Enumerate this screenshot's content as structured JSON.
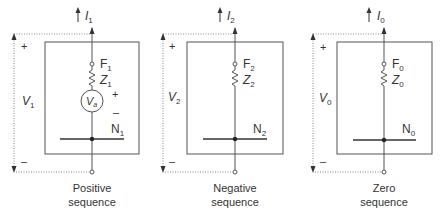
{
  "colors": {
    "line": "#555555",
    "dotted": "#888888",
    "text": "#333333",
    "background": "#ffffff"
  },
  "panels": [
    {
      "current": {
        "sym": "I",
        "sub": "1"
      },
      "voltage": {
        "sym": "V",
        "sub": "1"
      },
      "fault_node": {
        "sym": "F",
        "sub": "1"
      },
      "impedance": {
        "sym": "Z",
        "sub": "1"
      },
      "source": {
        "sym": "V",
        "sub": "a"
      },
      "neutral": {
        "sym": "N",
        "sub": "1"
      },
      "plus": "+",
      "minus": "–",
      "source_plus": "+",
      "source_minus": "–",
      "caption_line1": "Positive",
      "caption_line2": "sequence"
    },
    {
      "current": {
        "sym": "I",
        "sub": "2"
      },
      "voltage": {
        "sym": "V",
        "sub": "2"
      },
      "fault_node": {
        "sym": "F",
        "sub": "2"
      },
      "impedance": {
        "sym": "Z",
        "sub": "2"
      },
      "neutral": {
        "sym": "N",
        "sub": "2"
      },
      "plus": "+",
      "minus": "–",
      "caption_line1": "Negative",
      "caption_line2": "sequence"
    },
    {
      "current": {
        "sym": "I",
        "sub": "0"
      },
      "voltage": {
        "sym": "V",
        "sub": "0"
      },
      "fault_node": {
        "sym": "F",
        "sub": "0"
      },
      "impedance": {
        "sym": "Z",
        "sub": "0"
      },
      "neutral": {
        "sym": "N",
        "sub": "0"
      },
      "plus": "+",
      "minus": "–",
      "caption_line1": "Zero",
      "caption_line2": "sequence"
    }
  ]
}
